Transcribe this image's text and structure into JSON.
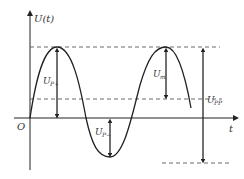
{
  "diagram": {
    "axes": {
      "y_label": "U(t)",
      "x_label": "t",
      "origin_label": "O"
    },
    "labels": {
      "positive_peak": {
        "main": "U",
        "sub": "P+"
      },
      "negative_peak": {
        "main": "U",
        "sub": "P−"
      },
      "amplitude": {
        "main": "U",
        "sub": "m"
      },
      "peak_to_peak": {
        "main": "U",
        "sub": "PP"
      }
    },
    "colors": {
      "line": "#222222",
      "dashed": "#444444",
      "background": "#ffffff"
    }
  }
}
